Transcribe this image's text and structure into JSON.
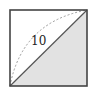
{
  "diagram": {
    "type": "geometry",
    "square": {
      "x": 10,
      "y": 10,
      "width": 77,
      "height": 76
    },
    "colors": {
      "stroke": "#444444",
      "shade": "#e2e2e2",
      "arc": "#9a9a9a",
      "background": "#ffffff"
    },
    "labels": {
      "diagonal_length": "10"
    }
  }
}
